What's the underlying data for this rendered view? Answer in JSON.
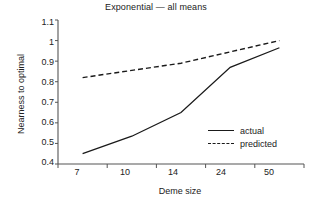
{
  "chart_data": {
    "type": "line",
    "title": "Exponential — all means",
    "xlabel": "Deme size",
    "ylabel": "Nearness to optimal",
    "categories": [
      "7",
      "10",
      "14",
      "24",
      "50"
    ],
    "ytick_labels": [
      "1.1",
      "1",
      "0.9",
      "0.8",
      "0.7",
      "0.6",
      "0.5",
      "0.4"
    ],
    "ytick_values": [
      1.1,
      1.0,
      0.9,
      0.8,
      0.7,
      0.6,
      0.5,
      0.4
    ],
    "ylim": [
      0.4,
      1.1
    ],
    "grid": false,
    "legend_position": "inside-lower-right",
    "series": [
      {
        "name": "actual",
        "style": "solid",
        "color": "#1a1a1a",
        "values": [
          0.45,
          0.535,
          0.65,
          0.87,
          0.965
        ]
      },
      {
        "name": "predicted",
        "style": "dashed",
        "color": "#1a1a1a",
        "values": [
          0.82,
          0.855,
          0.89,
          0.945,
          1.0
        ]
      }
    ]
  },
  "legend": {
    "items": [
      {
        "label": "actual"
      },
      {
        "label": "predicted"
      }
    ]
  },
  "axes": {
    "spine_color": "#555555"
  }
}
